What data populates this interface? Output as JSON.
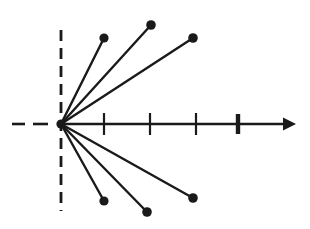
{
  "figure": {
    "title": "",
    "type": "pole-zero-root-locus-diagram",
    "background_color": "#ffffff",
    "ink_color": "#1a1a1a",
    "width": 310,
    "height": 229
  },
  "chart_data": {
    "type": "scatter",
    "title": "",
    "xlabel": "",
    "ylabel": "",
    "xlim": [
      -1.35,
      5.1
    ],
    "ylim": [
      -2.25,
      2.25
    ],
    "grid": false,
    "legend": null,
    "origin": {
      "x": 0,
      "y": 0,
      "px": 61,
      "py": 124
    },
    "scale": {
      "px_per_unit_x": 45.5,
      "px_per_unit_y": 45.5
    },
    "real_axis": {
      "style": "solid",
      "arrow": true,
      "start_px": 61,
      "end_px": 293,
      "y_px": 124,
      "dashed_extension_left": true,
      "ticks": [
        {
          "value": 1,
          "px": 104,
          "bold": false,
          "label": ""
        },
        {
          "value": 2,
          "px": 150,
          "bold": false,
          "label": ""
        },
        {
          "value": 3,
          "px": 196,
          "bold": false,
          "label": ""
        },
        {
          "value": 4,
          "px": 238,
          "bold": true,
          "label": ""
        }
      ]
    },
    "imaginary_axis": {
      "style": "dashed",
      "x_px": 61,
      "top_px": 30,
      "bottom_px": 211
    },
    "points": [
      {
        "id": "p1",
        "x": 0.95,
        "y": 1.89,
        "px": 104,
        "py": 38,
        "angle_deg": 63.3,
        "marker": "filled-circle"
      },
      {
        "id": "p2",
        "x": 1.98,
        "y": 2.18,
        "px": 151,
        "py": 25,
        "angle_deg": 47.7,
        "marker": "filled-circle"
      },
      {
        "id": "p3",
        "x": 2.9,
        "y": 1.89,
        "px": 193,
        "py": 38,
        "angle_deg": 33.1,
        "marker": "filled-circle"
      },
      {
        "id": "p4",
        "x": 0.95,
        "y": -1.69,
        "px": 104,
        "py": 201,
        "angle_deg": -60.7,
        "marker": "filled-circle"
      },
      {
        "id": "p5",
        "x": 1.89,
        "y": -1.93,
        "px": 147,
        "py": 212,
        "angle_deg": -45.6,
        "marker": "filled-circle"
      },
      {
        "id": "p6",
        "x": 2.9,
        "y": -1.63,
        "px": 193,
        "py": 198,
        "angle_deg": -29.1,
        "marker": "filled-circle"
      }
    ],
    "rays": [
      {
        "from": "origin",
        "to": "p1"
      },
      {
        "from": "origin",
        "to": "p2"
      },
      {
        "from": "origin",
        "to": "p3"
      },
      {
        "from": "origin",
        "to": "p4"
      },
      {
        "from": "origin",
        "to": "p5"
      },
      {
        "from": "origin",
        "to": "p6"
      }
    ]
  }
}
